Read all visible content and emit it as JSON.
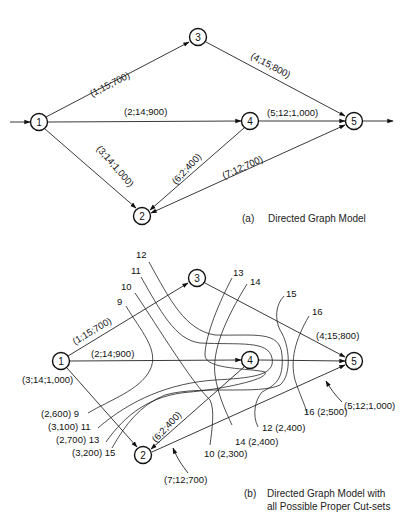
{
  "figure_a": {
    "caption_tag": "(a)",
    "caption": "Directed Graph Model",
    "nodes": [
      {
        "id": "1",
        "x": 39,
        "y": 122
      },
      {
        "id": "3",
        "x": 198,
        "y": 37
      },
      {
        "id": "4",
        "x": 250,
        "y": 121
      },
      {
        "id": "5",
        "x": 354,
        "y": 121
      },
      {
        "id": "2",
        "x": 142,
        "y": 216
      }
    ],
    "edges": [
      {
        "from": "1",
        "to": "3",
        "label": "(1;15;700)"
      },
      {
        "from": "1",
        "to": "4",
        "label": "(2;14;900)"
      },
      {
        "from": "1",
        "to": "2",
        "label": "(3;14;1,000)"
      },
      {
        "from": "3",
        "to": "5",
        "label": "(4;15;800)"
      },
      {
        "from": "4",
        "to": "5",
        "label": "(5;12;1,000)"
      },
      {
        "from": "4",
        "to": "2",
        "label": "(6;2;400)"
      },
      {
        "from": "2",
        "to": "5",
        "label": "(7;12;700)"
      }
    ]
  },
  "figure_b": {
    "caption_tag": "(b)",
    "caption_line1": "Directed Graph Model with",
    "caption_line2": "all Possible Proper Cut-sets",
    "nodes": [
      {
        "id": "1",
        "x": 61,
        "y": 361
      },
      {
        "id": "3",
        "x": 197,
        "y": 278
      },
      {
        "id": "4",
        "x": 250,
        "y": 360
      },
      {
        "id": "5",
        "x": 354,
        "y": 361
      },
      {
        "id": "2",
        "x": 143,
        "y": 455
      }
    ],
    "edge_labels": {
      "e1": "(1;15;700)",
      "e2": "(2;14;900)",
      "e3": "(3;14;1,000)",
      "e4": "(4;15;800)",
      "e5": "(5;12;1,000)",
      "e6": "(6;2;400)",
      "e7": "(7;12;700)"
    },
    "cut_sets": [
      {
        "id": "9",
        "value": "(2,600)",
        "label": "(2,600)  9"
      },
      {
        "id": "10",
        "value": "(2,300)",
        "label": "10 (2,300)"
      },
      {
        "id": "11",
        "value": "(3,100)",
        "label": "(3,100) 11"
      },
      {
        "id": "12",
        "value": "(2,400)",
        "label": "12  (2,400)"
      },
      {
        "id": "13",
        "value": "(2,700)",
        "label": "(2,700)  13"
      },
      {
        "id": "14",
        "value": "(2,400)",
        "label": "14 (2,400)"
      },
      {
        "id": "15",
        "value": "(3,200)",
        "label": "(3,200) 15"
      },
      {
        "id": "16",
        "value": "(2;500)",
        "label": "16 (2;500)"
      }
    ],
    "cut_top_labels": {
      "c9": "9",
      "c10": "10",
      "c11": "11",
      "c12": "12",
      "c13": "13",
      "c14": "14",
      "c15": "15",
      "c16": "16"
    }
  }
}
